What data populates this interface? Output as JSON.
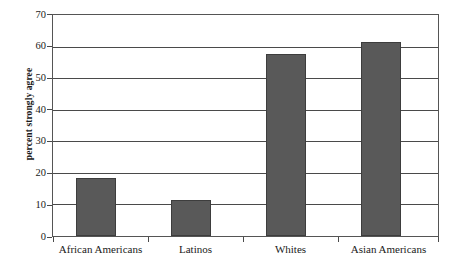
{
  "chart_data": {
    "type": "bar",
    "title": "",
    "subtitle": "",
    "xlabel": "",
    "ylabel": "percent strongly agree",
    "ylim": [
      0,
      70
    ],
    "ytick_step": 10,
    "yticks": [
      0,
      10,
      20,
      30,
      40,
      50,
      60,
      70
    ],
    "ytick_labels": [
      "0",
      "10",
      "20",
      "30",
      "40",
      "50",
      "60",
      "70"
    ],
    "grid": true,
    "grid_axis": "y",
    "legend": false,
    "legend_position": "none",
    "categories": [
      "African Americans",
      "Latinos",
      "Whites",
      "Asian Americans"
    ],
    "values": [
      18.5,
      11.3,
      57.8,
      61.3
    ],
    "bar_color": "#595959",
    "bar_edge_color": "#3d3d3d",
    "axis_color": "#4a4a4a",
    "background_color": "#ffffff"
  },
  "axes": {
    "y_title": "percent strongly agree",
    "y_tick_labels": [
      "70",
      "60",
      "50",
      "40",
      "30",
      "20",
      "10",
      "0"
    ],
    "x_tick_labels": [
      "African Americans",
      "Latinos",
      "Whites",
      "Asian Americans"
    ]
  }
}
